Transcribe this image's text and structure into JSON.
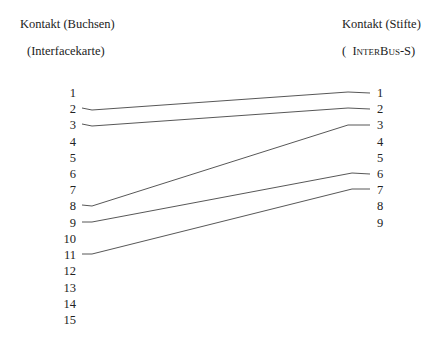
{
  "left_header": {
    "title": "Kontakt (Buchsen)",
    "subtitle": "(Interfacekarte)"
  },
  "right_header": {
    "title": "Kontakt (Stifte)",
    "subtitle_open": "(",
    "subtitle_name": "InterBus",
    "subtitle_suffix": "-S)"
  },
  "left_pins": [
    "1",
    "2",
    "3",
    "4",
    "5",
    "6",
    "7",
    "8",
    "9",
    "10",
    "11",
    "12",
    "13",
    "14",
    "15"
  ],
  "right_pins": [
    "1",
    "2",
    "3",
    "4",
    "5",
    "6",
    "7",
    "8",
    "9"
  ],
  "connections": [
    {
      "from": "2",
      "to": "1"
    },
    {
      "from": "3",
      "to": "2"
    },
    {
      "from": "8",
      "to": "3"
    },
    {
      "from": "9",
      "to": "6"
    },
    {
      "from": "11",
      "to": "7"
    }
  ],
  "line_color": "#444444"
}
